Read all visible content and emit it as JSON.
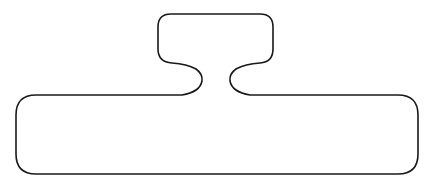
{
  "diagram": {
    "type": "outline-shape",
    "stroke_color": "#1a1a1a",
    "fill_color": "#ffffff",
    "stroke_width": 1.6,
    "parts": [
      {
        "name": "top-box",
        "x": 158,
        "y": 14,
        "width": 115,
        "height": 48,
        "corner_radius": 13
      },
      {
        "name": "neck",
        "left_inner_x": 201,
        "right_inner_x": 231,
        "y": 80
      },
      {
        "name": "body",
        "x": 16,
        "y": 95,
        "width": 402,
        "height": 79,
        "corner_radius": 20
      }
    ]
  }
}
